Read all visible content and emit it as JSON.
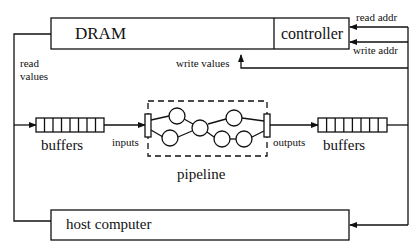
{
  "blocks": {
    "dram": "DRAM",
    "controller": "controller",
    "host": "host computer",
    "pipeline": "pipeline",
    "buffers_left": "buffers",
    "buffers_right": "buffers"
  },
  "edges": {
    "read_addr": "read addr",
    "write_addr": "write addr",
    "write_values": "write values",
    "read_values_line1": "read",
    "read_values_line2": "values",
    "inputs": "inputs",
    "outputs": "outputs"
  },
  "pipeline_nodes": 6,
  "buffer_cells": 8
}
